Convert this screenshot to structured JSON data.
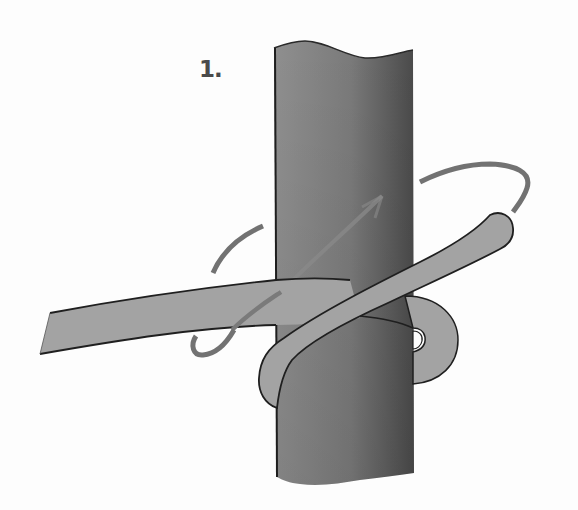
{
  "diagram": {
    "step_label": "1.",
    "elements": {
      "post": {
        "color_light": "#8e8e8e",
        "color_dark": "#4e4e4e",
        "outline": "#2a2a2a"
      },
      "rope": {
        "color": "#a3a3a3",
        "outline": "#1f1f1f"
      },
      "motion_arrow": {
        "color": "#6f6f6f",
        "meaning": "direction to wrap the rope end around the post"
      }
    }
  }
}
